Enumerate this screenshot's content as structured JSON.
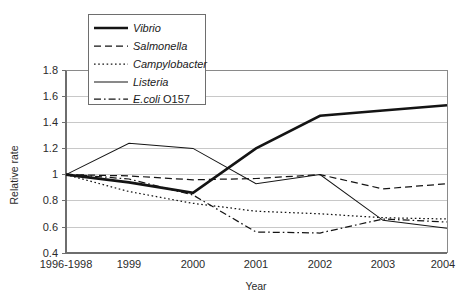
{
  "chart_data": {
    "type": "line",
    "title": "",
    "xlabel": "Year",
    "ylabel": "Relative rate",
    "categories": [
      "1996-1998",
      "1999",
      "2000",
      "2001",
      "2002",
      "2003",
      "2004"
    ],
    "ylim": [
      0.4,
      1.8
    ],
    "ytick_labels": [
      "1.8",
      "1.6",
      "1.4",
      "1.2",
      "1",
      "0.8",
      "0.6",
      "0.4"
    ],
    "ytick_values": [
      1.8,
      1.6,
      1.4,
      1.2,
      1.0,
      0.8,
      0.6,
      0.4
    ],
    "ytick_step": 0.2,
    "grid": "horizontal",
    "legend_position": "top-left-inside",
    "series": [
      {
        "name": "Vibrio",
        "style": "thick-solid",
        "values": [
          1.0,
          0.94,
          0.86,
          1.2,
          1.45,
          1.49,
          1.53
        ]
      },
      {
        "name": "Salmonella",
        "style": "dashed",
        "values": [
          1.0,
          0.99,
          0.96,
          0.97,
          1.0,
          0.89,
          0.93
        ]
      },
      {
        "name": "Campylobacter",
        "style": "dotted",
        "values": [
          1.0,
          0.87,
          0.78,
          0.72,
          0.7,
          0.67,
          0.66
        ]
      },
      {
        "name": "Listeria",
        "style": "thin-solid",
        "values": [
          1.0,
          1.24,
          1.2,
          0.93,
          1.0,
          0.65,
          0.59
        ]
      },
      {
        "name": "E.coli O157",
        "style": "dash-dot",
        "values": [
          1.0,
          0.96,
          0.84,
          0.56,
          0.55,
          0.65,
          0.63
        ]
      }
    ],
    "legend_entries": [
      {
        "label": "Vibrio",
        "label_upright_suffix": "",
        "style": "thick-solid"
      },
      {
        "label": "Salmonella",
        "label_upright_suffix": "",
        "style": "dashed"
      },
      {
        "label": "Campylobacter",
        "label_upright_suffix": "",
        "style": "dotted"
      },
      {
        "label": "Listeria",
        "label_upright_suffix": "",
        "style": "thin-solid"
      },
      {
        "label": "E.coli ",
        "label_upright_suffix": "O157",
        "style": "dash-dot"
      }
    ]
  }
}
